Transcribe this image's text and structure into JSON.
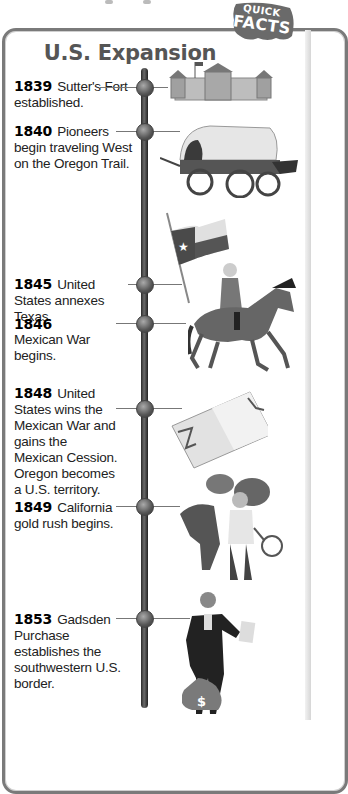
{
  "badge": {
    "line1": "QUICK",
    "line2": "FACTS"
  },
  "title": "U.S. Expansion",
  "timeline": [
    {
      "year": "1839",
      "text": "Sutter's Fort established.",
      "illustration": "fort-icon"
    },
    {
      "year": "1840",
      "text": "Pioneers begin traveling West on the Oregon Trail.",
      "illustration": "covered-wagon-icon"
    },
    {
      "year": "1845",
      "text": "United States annexes Texas.",
      "illustration": "texas-flag-icon"
    },
    {
      "year": "1846",
      "text": "Mexican War begins.",
      "illustration": "soldier-on-horse-icon"
    },
    {
      "year": "1848",
      "text": "United States wins the Mexican War and gains the Mexican Cession. Oregon becomes a U.S. territory.",
      "illustration": "treaty-document-icon"
    },
    {
      "year": "1849",
      "text": "California gold rush begins.",
      "illustration": "prospector-with-mule-icon"
    },
    {
      "year": "1853",
      "text": "Gadsden Purchase establishes the southwestern U.S. border.",
      "illustration": "man-with-money-bag-icon"
    }
  ],
  "colors": {
    "border": "#7a7a7a",
    "title": "#555555",
    "badge": "#6a6a6a",
    "spine": "#333333"
  }
}
